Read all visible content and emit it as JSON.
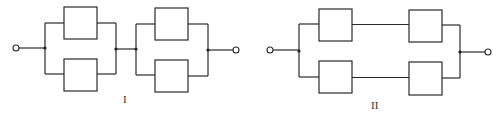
{
  "diagrams": [
    {
      "label": "I",
      "description": "Two parallel pairs connected in series",
      "components": 4
    },
    {
      "label": "II",
      "description": "Two series pairs connected in parallel",
      "components": 4
    }
  ],
  "colors": {
    "line": "#2a2a2a",
    "background": "#ffffff"
  }
}
